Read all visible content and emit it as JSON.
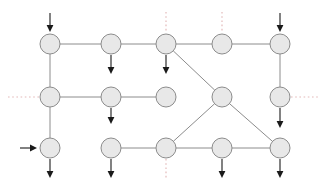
{
  "diagram": {
    "type": "flow-network-grid",
    "title": "",
    "canvas": {
      "width": 326,
      "height": 186,
      "background": "#ffffff"
    },
    "style": {
      "node_fill": "#e8e8e8",
      "node_stroke": "#8c8c8c",
      "node_radius": 10,
      "edge_color": "#8c8c8c",
      "arrow_color": "#1a1a1a",
      "dotted_color": "#e3b9b9"
    },
    "nodes": [
      {
        "id": "n-r1c1",
        "label": "",
        "x": 50,
        "y": 44
      },
      {
        "id": "n-r1c2",
        "label": "",
        "x": 111,
        "y": 44
      },
      {
        "id": "n-r1c3",
        "label": "",
        "x": 166,
        "y": 44
      },
      {
        "id": "n-r1c4",
        "label": "",
        "x": 222,
        "y": 44
      },
      {
        "id": "n-r1c5",
        "label": "",
        "x": 280,
        "y": 44
      },
      {
        "id": "n-r2c1",
        "label": "",
        "x": 50,
        "y": 97
      },
      {
        "id": "n-r2c2",
        "label": "",
        "x": 111,
        "y": 97
      },
      {
        "id": "n-r2c3",
        "label": "",
        "x": 166,
        "y": 97
      },
      {
        "id": "n-r2c4",
        "label": "",
        "x": 222,
        "y": 97
      },
      {
        "id": "n-r2c5",
        "label": "",
        "x": 280,
        "y": 97
      },
      {
        "id": "n-r3c1",
        "label": "",
        "x": 50,
        "y": 148
      },
      {
        "id": "n-r3c2",
        "label": "",
        "x": 111,
        "y": 148
      },
      {
        "id": "n-r3c3",
        "label": "",
        "x": 166,
        "y": 148
      },
      {
        "id": "n-r3c4",
        "label": "",
        "x": 222,
        "y": 148
      },
      {
        "id": "n-r3c5",
        "label": "",
        "x": 280,
        "y": 148
      }
    ],
    "edges": [
      {
        "id": "e-r1c1-r1c2",
        "from": "n-r1c1",
        "to": "n-r1c2"
      },
      {
        "id": "e-r1c2-r1c3",
        "from": "n-r1c2",
        "to": "n-r1c3"
      },
      {
        "id": "e-r1c3-r1c4",
        "from": "n-r1c3",
        "to": "n-r1c4"
      },
      {
        "id": "e-r1c4-r1c5",
        "from": "n-r1c4",
        "to": "n-r1c5"
      },
      {
        "id": "e-r1c1-r2c1",
        "from": "n-r1c1",
        "to": "n-r2c1"
      },
      {
        "id": "e-r1c5-r2c5",
        "from": "n-r1c5",
        "to": "n-r2c5"
      },
      {
        "id": "e-r2c1-r2c2",
        "from": "n-r2c1",
        "to": "n-r2c2"
      },
      {
        "id": "e-r2c2-r2c3",
        "from": "n-r2c2",
        "to": "n-r2c3"
      },
      {
        "id": "e-r2c1-r3c1",
        "from": "n-r2c1",
        "to": "n-r3c1"
      },
      {
        "id": "e-r1c3-r2c4",
        "from": "n-r1c3",
        "to": "n-r2c4"
      },
      {
        "id": "e-r2c4-r3c3",
        "from": "n-r2c4",
        "to": "n-r3c3"
      },
      {
        "id": "e-r2c4-r3c5",
        "from": "n-r2c4",
        "to": "n-r3c5"
      },
      {
        "id": "e-r3c2-r3c3",
        "from": "n-r3c2",
        "to": "n-r3c3"
      },
      {
        "id": "e-r3c3-r3c4",
        "from": "n-r3c3",
        "to": "n-r3c4"
      },
      {
        "id": "e-r3c4-r3c5",
        "from": "n-r3c4",
        "to": "n-r3c5"
      }
    ],
    "arrows": [
      {
        "id": "a-in-r1c1",
        "node": "n-r1c1",
        "direction": "in-down",
        "x1": 50,
        "y1": 13,
        "x2": 50,
        "y2": 32
      },
      {
        "id": "a-in-r1c5",
        "node": "n-r1c5",
        "direction": "in-down",
        "x1": 280,
        "y1": 13,
        "x2": 280,
        "y2": 32
      },
      {
        "id": "a-in-r3c1",
        "node": "n-r3c1",
        "direction": "in-right",
        "x1": 20,
        "y1": 148,
        "x2": 37,
        "y2": 148
      },
      {
        "id": "a-out-r1c2",
        "node": "n-r1c2",
        "direction": "out-down",
        "x1": 111,
        "y1": 55,
        "x2": 111,
        "y2": 74
      },
      {
        "id": "a-out-r1c3",
        "node": "n-r1c3",
        "direction": "out-down",
        "x1": 166,
        "y1": 55,
        "x2": 166,
        "y2": 74
      },
      {
        "id": "a-out-r2c2",
        "node": "n-r2c2",
        "direction": "out-down",
        "x1": 111,
        "y1": 108,
        "x2": 111,
        "y2": 124
      },
      {
        "id": "a-out-r2c5",
        "node": "n-r2c5",
        "direction": "out-down",
        "x1": 280,
        "y1": 108,
        "x2": 280,
        "y2": 128
      },
      {
        "id": "a-out-r3c1",
        "node": "n-r3c1",
        "direction": "out-down",
        "x1": 50,
        "y1": 159,
        "x2": 50,
        "y2": 178
      },
      {
        "id": "a-out-r3c2",
        "node": "n-r3c2",
        "direction": "out-down",
        "x1": 111,
        "y1": 159,
        "x2": 111,
        "y2": 178
      },
      {
        "id": "a-out-r3c4",
        "node": "n-r3c4",
        "direction": "out-down",
        "x1": 222,
        "y1": 159,
        "x2": 222,
        "y2": 178
      },
      {
        "id": "a-out-r3c5",
        "node": "n-r3c5",
        "direction": "out-down",
        "x1": 280,
        "y1": 159,
        "x2": 280,
        "y2": 178
      }
    ],
    "dotted_connections": [
      {
        "id": "d-top-r1c3",
        "node": "n-r1c3",
        "orientation": "vertical",
        "x1": 166,
        "y1": 12,
        "x2": 166,
        "y2": 33
      },
      {
        "id": "d-top-r1c4",
        "node": "n-r1c4",
        "orientation": "vertical",
        "x1": 222,
        "y1": 12,
        "x2": 222,
        "y2": 33
      },
      {
        "id": "d-left-r2c1",
        "node": "n-r2c1",
        "orientation": "horizontal",
        "x1": 8,
        "y1": 97,
        "x2": 39,
        "y2": 97
      },
      {
        "id": "d-right-r2c5",
        "node": "n-r2c5",
        "orientation": "horizontal",
        "x1": 291,
        "y1": 97,
        "x2": 320,
        "y2": 97
      },
      {
        "id": "d-bot-r3c3",
        "node": "n-r3c3",
        "orientation": "vertical",
        "x1": 166,
        "y1": 159,
        "x2": 166,
        "y2": 180
      }
    ]
  }
}
